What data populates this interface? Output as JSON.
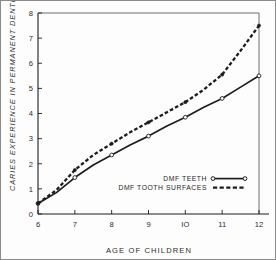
{
  "figure": {
    "border_color": "#8a8a8a",
    "background": "#fdfdfd",
    "ink_color": "#1d1d1d"
  },
  "chart_data": {
    "type": "line",
    "title": "",
    "xlabel": "AGE OF CHILDREN",
    "ylabel": "CARIES EXPERIENCE IN PERMANENT DENTITION",
    "xlim": [
      6,
      12
    ],
    "ylim": [
      0,
      8
    ],
    "xticks": [
      6,
      7,
      8,
      9,
      10,
      11,
      12
    ],
    "xtick_labels": [
      "6",
      "7",
      "8",
      "9",
      "IO",
      "11",
      "12"
    ],
    "yticks": [
      0,
      1,
      2,
      3,
      4,
      5,
      6,
      7,
      8
    ],
    "ytick_labels": [
      "0",
      "1",
      "2",
      "3",
      "4",
      "5",
      "6",
      "7",
      "8"
    ],
    "grid": false,
    "legend_position": "center-right",
    "x": [
      6,
      6.5,
      7,
      7.5,
      8,
      8.5,
      9,
      9.5,
      10,
      10.5,
      11,
      11.5,
      12
    ],
    "series": [
      {
        "name": "DMF TEETH",
        "style": "solid",
        "marker": "open-circle",
        "color": "#1d1d1d",
        "values": [
          0.42,
          0.85,
          1.45,
          1.95,
          2.35,
          2.75,
          3.1,
          3.5,
          3.85,
          4.25,
          4.6,
          5.05,
          5.5
        ],
        "marker_points": [
          {
            "x": 6,
            "y": 0.42
          },
          {
            "x": 7,
            "y": 1.45
          },
          {
            "x": 8,
            "y": 2.35
          },
          {
            "x": 9,
            "y": 3.1
          },
          {
            "x": 10,
            "y": 3.85
          },
          {
            "x": 11,
            "y": 4.6
          },
          {
            "x": 12,
            "y": 5.5
          }
        ]
      },
      {
        "name": "DMF TOOTH SURFACES",
        "style": "dashed",
        "marker": "filled-circle",
        "color": "#1d1d1d",
        "values": [
          0.42,
          0.95,
          1.75,
          2.35,
          2.8,
          3.25,
          3.65,
          4.05,
          4.45,
          4.95,
          5.55,
          6.5,
          7.5
        ],
        "marker_points": [
          {
            "x": 6,
            "y": 0.42
          },
          {
            "x": 7,
            "y": 1.75
          },
          {
            "x": 8,
            "y": 2.8
          },
          {
            "x": 9,
            "y": 3.65
          },
          {
            "x": 10,
            "y": 4.45
          },
          {
            "x": 11,
            "y": 5.55
          },
          {
            "x": 12,
            "y": 7.5
          }
        ]
      }
    ],
    "legend": [
      {
        "label": "DMF TEETH",
        "style": "solid",
        "marker": "open-circle"
      },
      {
        "label": "DMF TOOTH SURFACES",
        "style": "dashed",
        "marker": "filled-square"
      }
    ]
  }
}
